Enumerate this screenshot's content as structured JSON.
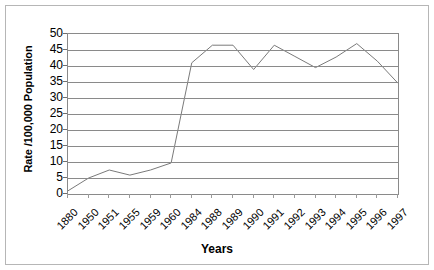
{
  "chart": {
    "y_axis_title": "Rate /100,000 Population",
    "x_axis_title": "Years"
  },
  "chart_data": {
    "type": "line",
    "title": "",
    "xlabel": "Years",
    "ylabel": "Rate /100,000 Population",
    "ylim": [
      0,
      50
    ],
    "yticks": [
      0,
      5,
      10,
      15,
      20,
      25,
      30,
      35,
      40,
      45,
      50
    ],
    "grid": true,
    "legend": "none",
    "line_color": "#7a7a7a",
    "categories": [
      "1880",
      "1950",
      "1951",
      "1955",
      "1959",
      "1960",
      "1984",
      "1988",
      "1989",
      "1990",
      "1991",
      "1992",
      "1993",
      "1994",
      "1995",
      "1996",
      "1997"
    ],
    "series": [
      {
        "name": "Rate",
        "values": [
          1.0,
          5.0,
          7.5,
          5.9,
          7.5,
          9.7,
          41.0,
          46.5,
          46.5,
          38.9,
          46.5,
          43.0,
          39.5,
          42.8,
          47.0,
          41.5,
          34.6
        ]
      }
    ]
  }
}
